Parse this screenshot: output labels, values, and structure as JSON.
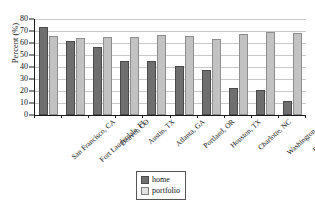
{
  "chart_data": {
    "type": "bar",
    "title": "",
    "subtitle": "",
    "xlabel": "",
    "ylabel": "Percent (%)",
    "ylim": [
      0,
      80
    ],
    "ytick_step": 10,
    "yticks": [
      80,
      70,
      60,
      50,
      40,
      30,
      20,
      10,
      0
    ],
    "grid": true,
    "legend_position": "bottom-center",
    "categories": [
      "San Francisco, CA",
      "Fort Lauderdale, FL",
      "Denver, CO",
      "Austin, TX",
      "Atlanta, GA",
      "Portland, OR",
      "Houston, TX",
      "Charlotte, NC",
      "Washington, DC",
      "Baltimore, MD"
    ],
    "series": [
      {
        "name": "home",
        "color": "#6f6f6f",
        "values": [
          73,
          62,
          56.5,
          45,
          45,
          40.5,
          37.5,
          22.5,
          20.5,
          12
        ]
      },
      {
        "name": "portfolio",
        "color": "#c2c2c2",
        "values": [
          66,
          64,
          65,
          65,
          66.5,
          65.5,
          63.5,
          67.5,
          69.5,
          68.5
        ]
      }
    ]
  },
  "legend": {
    "items": [
      {
        "label": "home"
      },
      {
        "label": "portfolio"
      }
    ]
  }
}
